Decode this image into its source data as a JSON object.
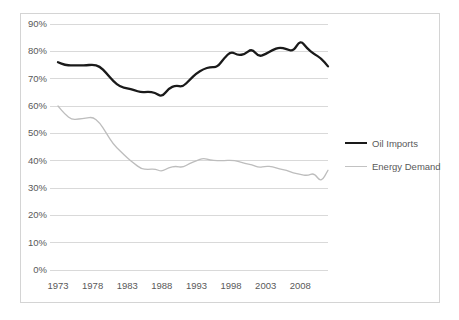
{
  "chart_data": {
    "type": "line",
    "title": "",
    "xlabel": "",
    "ylabel": "",
    "xlim": [
      1973,
      2012
    ],
    "ylim": [
      0,
      90
    ],
    "grid": true,
    "legend_position": "right",
    "y_ticks": [
      "0%",
      "10%",
      "20%",
      "30%",
      "40%",
      "50%",
      "60%",
      "70%",
      "80%",
      "90%"
    ],
    "y_tick_values": [
      0,
      10,
      20,
      30,
      40,
      50,
      60,
      70,
      80,
      90
    ],
    "x_ticks": [
      "1973",
      "1978",
      "1983",
      "1988",
      "1993",
      "1998",
      "2003",
      "2008"
    ],
    "x_tick_values": [
      1973,
      1978,
      1983,
      1988,
      1993,
      1998,
      2003,
      2008
    ],
    "x": [
      1973,
      1974,
      1975,
      1976,
      1977,
      1978,
      1979,
      1980,
      1981,
      1982,
      1983,
      1984,
      1985,
      1986,
      1987,
      1988,
      1989,
      1990,
      1991,
      1992,
      1993,
      1994,
      1995,
      1996,
      1997,
      1998,
      1999,
      2000,
      2001,
      2002,
      2003,
      2004,
      2005,
      2006,
      2007,
      2008,
      2009,
      2010,
      2011,
      2012
    ],
    "series": [
      {
        "name": "Oil Imports",
        "color": "#1a1a1a",
        "width": "thick",
        "values": [
          76.0,
          75.0,
          74.8,
          74.9,
          74.8,
          75.2,
          74.6,
          72.0,
          69.0,
          67.0,
          66.5,
          65.8,
          65.0,
          65.2,
          65.0,
          63.2,
          66.5,
          67.5,
          67.0,
          69.5,
          72.0,
          73.5,
          74.3,
          74.2,
          77.5,
          80.0,
          78.5,
          79.0,
          81.0,
          78.0,
          79.0,
          80.5,
          81.5,
          80.8,
          80.0,
          84.2,
          81.0,
          79.0,
          77.5,
          74.5
        ]
      },
      {
        "name": "Energy Demand",
        "color": "#bdbdbd",
        "width": "thin",
        "values": [
          60.0,
          57.0,
          55.0,
          55.2,
          55.5,
          56.0,
          54.0,
          50.0,
          46.0,
          43.5,
          41.0,
          39.0,
          37.0,
          36.8,
          37.0,
          36.0,
          37.5,
          38.0,
          37.5,
          39.0,
          40.0,
          41.0,
          40.2,
          40.0,
          40.0,
          40.2,
          39.8,
          39.0,
          38.5,
          37.5,
          38.0,
          37.8,
          37.0,
          36.5,
          35.5,
          35.0,
          34.5,
          35.5,
          32.0,
          36.5
        ]
      }
    ]
  },
  "legend": {
    "items": [
      {
        "label": "Oil Imports"
      },
      {
        "label": "Energy Demand"
      }
    ]
  }
}
